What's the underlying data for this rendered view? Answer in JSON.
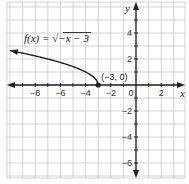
{
  "chart_data": {
    "type": "line",
    "title": "",
    "function_label": "f(x) = √(−x − 3)",
    "function_label_parts": {
      "lhs": "f(x) = ",
      "radicand": "−x − 3"
    },
    "xlabel": "x",
    "ylabel": "y",
    "xlim": [
      -10.2,
      3.9
    ],
    "ylim": [
      -7.3,
      6.5
    ],
    "grid": true,
    "x_ticks": [
      -8,
      -6,
      -4,
      -2,
      0,
      2
    ],
    "x_tick_labels": [
      "−8",
      "−6",
      "−4",
      "−2",
      "0",
      "2"
    ],
    "y_ticks": [
      4,
      2,
      -2,
      -4,
      -6
    ],
    "y_tick_labels": [
      "4",
      "2",
      "−2",
      "−4",
      "−6"
    ],
    "series": [
      {
        "name": "f(x) = sqrt(-x - 3)",
        "x": [
          -3,
          -3.25,
          -3.5,
          -4,
          -5,
          -6,
          -7,
          -8,
          -9,
          -10
        ],
        "y": [
          0,
          0.5,
          0.707,
          1.0,
          1.414,
          1.732,
          2.0,
          2.236,
          2.449,
          2.646
        ],
        "color": "#222222",
        "arrow_end": "left"
      }
    ],
    "annotations": [
      {
        "text": "(−3, 0)",
        "x": -3,
        "y": 0,
        "marker": "filled-circle"
      }
    ]
  },
  "colors": {
    "grid": "#c8c8c8",
    "axis": "#222222",
    "curve": "#222222",
    "background": "#ffffff"
  }
}
